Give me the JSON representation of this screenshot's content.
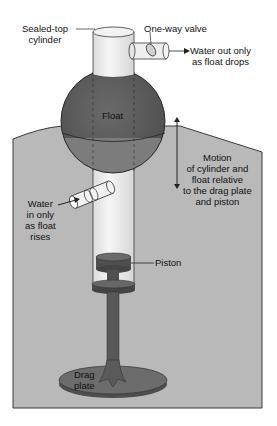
{
  "diagram": {
    "type": "mechanical schematic",
    "colors": {
      "background": "#ffffff",
      "water": "#b9b9b9",
      "water_edge": "#444444",
      "float_dark": "#5f5f5f",
      "float_submerged": "#7a7a7a",
      "cylinder_glass": "#ececec",
      "piston": "#555555",
      "outline": "#2a2a2a"
    },
    "labels": {
      "sealed_top_cylinder": [
        "Sealed-top",
        "cylinder"
      ],
      "one_way_valve": "One-way valve",
      "water_out": [
        "Water out only",
        "as float drops"
      ],
      "float": "Float",
      "motion": [
        "Motion",
        "of cylinder and",
        "float relative",
        "to the drag plate",
        "and piston"
      ],
      "water_in": [
        "Water",
        "in only",
        "as float",
        "rises"
      ],
      "piston": "Piston",
      "drag_plate": [
        "Drag",
        "plate"
      ]
    }
  }
}
